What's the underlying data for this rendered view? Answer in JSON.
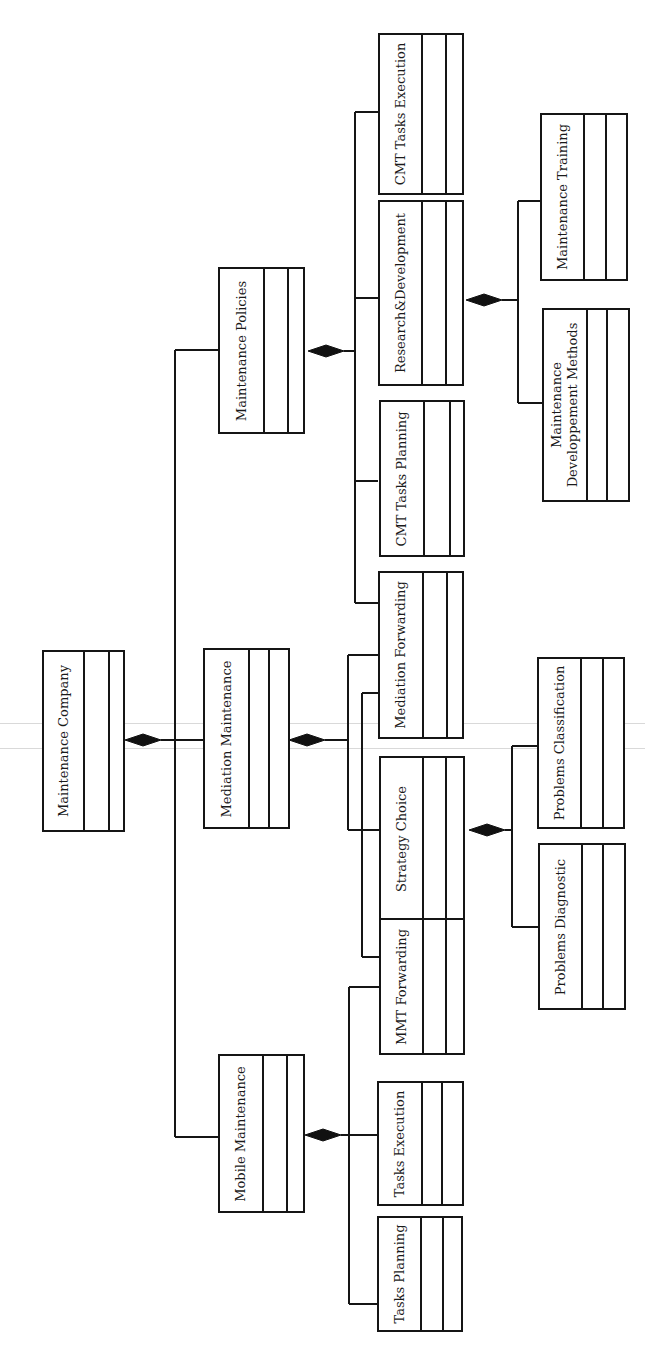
{
  "diagram": {
    "type": "UML class diagram (composition hierarchy, rotated 90°)",
    "colors": {
      "background": "#ffffff",
      "line": "#151515",
      "text": "#1a1a1a",
      "scan_line": "#d9d9d9"
    },
    "root": "Maintenance Company",
    "classes": [
      {
        "id": "maintenance-company",
        "label": "Maintenance Company",
        "x": 42,
        "y": 650,
        "w": 83,
        "h": 182,
        "nameW": 41,
        "attrW": 25
      },
      {
        "id": "maintenance-policies",
        "label": "Maintenance Policies",
        "x": 218,
        "y": 267,
        "w": 87,
        "h": 167,
        "nameW": 45,
        "attrW": 24
      },
      {
        "id": "mediation-maintenance",
        "label": "Mediation Maintenance",
        "x": 203,
        "y": 648,
        "w": 87,
        "h": 181,
        "nameW": 45,
        "attrW": 20
      },
      {
        "id": "mobile-maintenance",
        "label": "Mobile Maintenance",
        "x": 218,
        "y": 1054,
        "w": 87,
        "h": 159,
        "nameW": 44,
        "attrW": 24
      },
      {
        "id": "cmt-tasks-execution",
        "label": "CMT Tasks Execution",
        "x": 378,
        "y": 33,
        "w": 86,
        "h": 162,
        "nameW": 43,
        "attrW": 24
      },
      {
        "id": "research-development",
        "label": "Research&Development",
        "x": 378,
        "y": 200,
        "w": 86,
        "h": 186,
        "nameW": 43,
        "attrW": 24
      },
      {
        "id": "cmt-tasks-planning",
        "label": "CMT Tasks Planning",
        "x": 379,
        "y": 400,
        "w": 86,
        "h": 157,
        "nameW": 44,
        "attrW": 26
      },
      {
        "id": "mediation-forwarding",
        "label": "Mediation Forwarding",
        "x": 378,
        "y": 571,
        "w": 86,
        "h": 168,
        "nameW": 44,
        "attrW": 24
      },
      {
        "id": "strategy-choice",
        "label": "Strategy Choice",
        "x": 379,
        "y": 756,
        "w": 86,
        "h": 165,
        "nameW": 43,
        "attrW": 23
      },
      {
        "id": "mmt-forwarding",
        "label": "MMT Forwarding",
        "x": 379,
        "y": 918,
        "w": 86,
        "h": 137,
        "nameW": 43,
        "attrW": 23
      },
      {
        "id": "tasks-execution",
        "label": "Tasks Execution",
        "x": 377,
        "y": 1081,
        "w": 87,
        "h": 125,
        "nameW": 44,
        "attrW": 20
      },
      {
        "id": "tasks-planning",
        "label": "Tasks Planning",
        "x": 377,
        "y": 1216,
        "w": 86,
        "h": 116,
        "nameW": 43,
        "attrW": 22
      },
      {
        "id": "maintenance-training",
        "label": "Maintenance Training",
        "x": 540,
        "y": 113,
        "w": 88,
        "h": 168,
        "nameW": 43,
        "attrW": 22
      },
      {
        "id": "maintenance-developpement-methods",
        "label": "Maintenance\nDeveloppement Methods",
        "x": 542,
        "y": 308,
        "w": 88,
        "h": 194,
        "nameW": 44,
        "attrW": 20
      },
      {
        "id": "problems-classification",
        "label": "Problems Classification",
        "x": 537,
        "y": 657,
        "w": 88,
        "h": 172,
        "nameW": 43,
        "attrW": 22
      },
      {
        "id": "problems-diagnostic",
        "label": "Problems Diagnostic",
        "x": 538,
        "y": 843,
        "w": 88,
        "h": 167,
        "nameW": 43,
        "attrW": 21
      }
    ],
    "compositions": [
      {
        "parent": "Maintenance Company",
        "children": [
          "Maintenance Policies",
          "Mediation Maintenance",
          "Mobile Maintenance"
        ]
      },
      {
        "parent": "Maintenance Policies",
        "children": [
          "CMT Tasks Execution",
          "Research&Development",
          "CMT Tasks Planning",
          "Mediation Forwarding"
        ]
      },
      {
        "parent": "Mediation Maintenance",
        "children": [
          "Mediation Forwarding",
          "Strategy Choice",
          "MMT Forwarding"
        ]
      },
      {
        "parent": "Mobile Maintenance",
        "children": [
          "MMT Forwarding",
          "Tasks Execution",
          "Tasks Planning"
        ]
      },
      {
        "parent": "Research&Development",
        "children": [
          "Maintenance Training",
          "Maintenance Developpement Methods"
        ]
      },
      {
        "parent": "Strategy Choice",
        "children": [
          "Problems Classification",
          "Problems Diagnostic"
        ]
      }
    ],
    "diamonds": [
      {
        "id": "diamond-maintenance-company",
        "cx": 143,
        "y": 740
      },
      {
        "id": "diamond-maintenance-policies",
        "cx": 326,
        "y": 351
      },
      {
        "id": "diamond-mediation-maintenance",
        "cx": 307,
        "y": 740
      },
      {
        "id": "diamond-mobile-maintenance",
        "cx": 323,
        "y": 1135
      },
      {
        "id": "diamond-research-development",
        "cx": 484,
        "y": 300
      },
      {
        "id": "diamond-strategy-choice",
        "cx": 487,
        "y": 830
      }
    ],
    "wires": [
      "M 161 740 L 175 740",
      "M 175 350 L 175 1137",
      "M 175 350 L 218 350",
      "M 175 740 L 203 740",
      "M 175 1137 L 218 1137",
      "M 344 351 L 355 351",
      "M 355 112 L 355 603",
      "M 355 112 L 378 112",
      "M 355 298 L 378 298",
      "M 355 481 L 378 481",
      "M 355 603 L 378 603",
      "M 325 740 L 348 740",
      "M 348 655 L 348 830",
      "M 348 655 L 378 655",
      "M 348 830 L 379 830",
      "M 362 693 L 362 957",
      "M 362 693 L 378 693",
      "M 362 957 L 379 957",
      "M 341 1135 L 377 1135",
      "M 349 987 L 349 1304",
      "M 349 987 L 379 987",
      "M 349 1304 L 377 1304",
      "M 502 300 L 518 300",
      "M 518 201 L 518 403",
      "M 518 201 L 540 201",
      "M 518 403 L 542 403",
      "M 505 830 L 512 830",
      "M 512 746 L 512 927",
      "M 512 746 L 537 746",
      "M 512 927 L 538 927"
    ],
    "scan_lines": [
      {
        "y": 723
      },
      {
        "y": 748
      }
    ]
  }
}
